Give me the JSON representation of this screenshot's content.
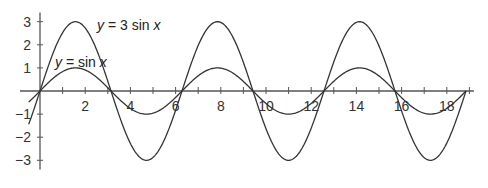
{
  "chart_data": {
    "type": "line",
    "title": "",
    "xlabel": "",
    "ylabel": "",
    "xlim": [
      -0.6,
      19.2
    ],
    "ylim": [
      -3.4,
      3.4
    ],
    "grid": false,
    "x_ticks": [
      2,
      4,
      6,
      8,
      10,
      12,
      14,
      16,
      18
    ],
    "x_minor_ticks_step": 1,
    "y_ticks": [
      -3,
      -2,
      -1,
      1,
      2,
      3
    ],
    "series": [
      {
        "name": "y = 3 sin x",
        "function": "3*sin(x)",
        "x_range": [
          -0.5,
          18.85
        ],
        "amplitude": 3,
        "label": {
          "pre": "y",
          "mid": " = 3 sin ",
          "post": "x"
        }
      },
      {
        "name": "y = sin x",
        "function": "sin(x)",
        "x_range": [
          -0.5,
          18.85
        ],
        "amplitude": 1,
        "label": {
          "pre": "y",
          "mid": " = sin ",
          "post": "x"
        }
      }
    ],
    "annotations": [
      "y = 3 sin x",
      "y = sin x"
    ]
  },
  "colors": {
    "curve": "#333333",
    "axis": "#555555",
    "text": "#333333",
    "background": "#ffffff"
  }
}
